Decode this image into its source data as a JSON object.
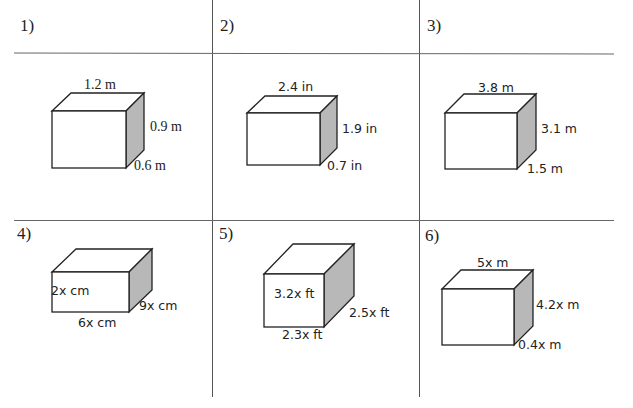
{
  "worksheet": {
    "problems": [
      {
        "number": "1)",
        "length": "1.2 m",
        "height": "0.9 m",
        "width": "0.6 m"
      },
      {
        "number": "2)",
        "length": "2.4 in",
        "height": "1.9 in",
        "width": "0.7 in"
      },
      {
        "number": "3)",
        "length": "3.8 m",
        "height": "3.1 m",
        "width": "1.5 m"
      },
      {
        "number": "4)",
        "height": "2x cm",
        "width": "9x cm",
        "length": "6x cm"
      },
      {
        "number": "5)",
        "height": "3.2x ft",
        "width": "2.5x ft",
        "length": "2.3x ft"
      },
      {
        "number": "6)",
        "length": "5x m",
        "height": "4.2x m",
        "width": "0.4x m"
      }
    ],
    "colors": {
      "line": "#555555",
      "box_side_shade": "#b8b8b8",
      "text": "#222222"
    }
  }
}
